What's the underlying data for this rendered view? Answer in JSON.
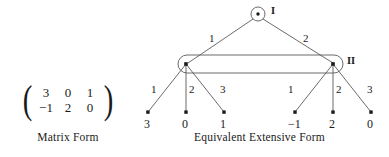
{
  "figure": {
    "matrix_panel": {
      "caption": "Matrix Form",
      "rows": [
        [
          "3",
          "0",
          "1"
        ],
        [
          "−1",
          "2",
          "0"
        ]
      ],
      "left_bracket": "(",
      "right_bracket": ")"
    },
    "tree_panel": {
      "caption": "Equivalent Extensive Form",
      "root": {
        "player_label": "I",
        "shape": "circle"
      },
      "information_set": {
        "player_label": "II",
        "shape": "rounded-rectangle"
      },
      "top_edges": [
        {
          "label": "1",
          "to": "left-decision-node"
        },
        {
          "label": "2",
          "to": "right-decision-node"
        }
      ],
      "left_branch_edges": [
        {
          "label": "1",
          "payoff": "3"
        },
        {
          "label": "2",
          "payoff": "0"
        },
        {
          "label": "3",
          "payoff": "1"
        }
      ],
      "right_branch_edges": [
        {
          "label": "1",
          "payoff": "−1"
        },
        {
          "label": "2",
          "payoff": "2"
        },
        {
          "label": "3",
          "payoff": "0"
        }
      ]
    }
  },
  "colors": {
    "ink": "#1a1a1a",
    "line": "#5a5a5a",
    "background": "#ffffff"
  }
}
